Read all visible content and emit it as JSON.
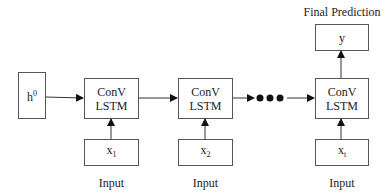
{
  "diagram": {
    "initial_state": {
      "base": "h",
      "sup": "0"
    },
    "cells": [
      {
        "line1": "ConV",
        "line2": "LSTM"
      },
      {
        "line1": "ConV",
        "line2": "LSTM"
      },
      {
        "line1": "ConV",
        "line2": "LSTM"
      }
    ],
    "inputs": [
      {
        "base": "x",
        "sub": "1",
        "label": "Input"
      },
      {
        "base": "x",
        "sub": "2",
        "label": "Input"
      },
      {
        "base": "x",
        "sub": "t",
        "label": "Input"
      }
    ],
    "output": {
      "value": "y",
      "label": "Final Prediction"
    },
    "ellipsis": "•••"
  }
}
